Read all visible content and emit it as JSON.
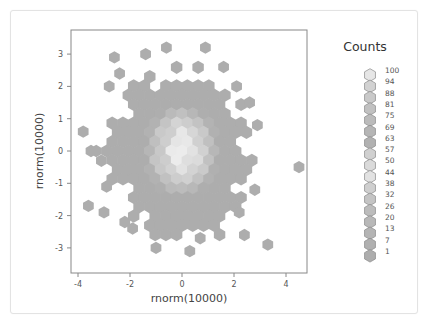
{
  "chart_data": {
    "type": "heatmap",
    "subtype": "hexbin",
    "title": "",
    "xlabel": "rnorm(10000)",
    "ylabel": "rnorm(10000)",
    "xlim": [
      -4.2,
      4.8
    ],
    "ylim": [
      -3.6,
      3.7
    ],
    "x_ticks": [
      -4,
      -2,
      0,
      2,
      4
    ],
    "x_tick_labels": [
      "-4",
      "-2",
      "0",
      "2",
      "4"
    ],
    "y_ticks": [
      -3,
      -2,
      -1,
      0,
      1,
      2,
      3
    ],
    "y_tick_labels": [
      "-3",
      "-2",
      "-1",
      "0",
      "1",
      "2",
      "3"
    ],
    "grid": false,
    "n_points": 10000,
    "distribution": "bivariate standard normal",
    "peak_count": 100,
    "min_count": 1,
    "hex_radius_units": 0.2,
    "sparse_hexes": [
      {
        "x": -3.8,
        "y": 0.6
      },
      {
        "x": -3.5,
        "y": 0.0
      },
      {
        "x": -3.3,
        "y": 0.0
      },
      {
        "x": -3.1,
        "y": -0.3
      },
      {
        "x": -3.6,
        "y": -1.7
      },
      {
        "x": -3.0,
        "y": -1.9
      },
      {
        "x": -2.6,
        "y": 2.9
      },
      {
        "x": -1.4,
        "y": 3.0
      },
      {
        "x": -0.6,
        "y": 3.2
      },
      {
        "x": 0.9,
        "y": 3.2
      },
      {
        "x": 1.6,
        "y": 2.6
      },
      {
        "x": 2.1,
        "y": 2.0
      },
      {
        "x": 2.6,
        "y": 1.5
      },
      {
        "x": 4.5,
        "y": -0.5
      },
      {
        "x": 2.2,
        "y": -1.9
      },
      {
        "x": 3.3,
        "y": -2.9
      },
      {
        "x": -2.9,
        "y": -1.1
      },
      {
        "x": -2.2,
        "y": -2.2
      },
      {
        "x": -1.9,
        "y": -2.4
      },
      {
        "x": 0.3,
        "y": -3.1
      },
      {
        "x": 0.7,
        "y": -2.7
      },
      {
        "x": -1.0,
        "y": -3.0
      },
      {
        "x": 2.4,
        "y": -2.6
      },
      {
        "x": -2.4,
        "y": 2.4
      },
      {
        "x": -2.8,
        "y": 2.0
      },
      {
        "x": 2.9,
        "y": 0.8
      },
      {
        "x": 2.8,
        "y": -1.2
      }
    ]
  },
  "legend": {
    "title": "Counts",
    "levels": [
      "100",
      "94",
      "88",
      "81",
      "75",
      "69",
      "63",
      "57",
      "50",
      "44",
      "38",
      "32",
      "26",
      "20",
      "13",
      "7",
      "1"
    ],
    "colors": [
      "#e6e6e6",
      "#d2d2d2",
      "#c9c9c9",
      "#c1c1c1",
      "#bbbbbb",
      "#b5b5b5",
      "#b1b1b1",
      "#d0d0d0",
      "#dadada",
      "#e2e2e2",
      "#cfcfcf",
      "#c4c4c4",
      "#bcbcbc",
      "#b8b8b8",
      "#b4b4b4",
      "#b0b0b0",
      "#adadad"
    ]
  },
  "colors": {
    "hex_low": "#adadad",
    "hex_high": "#eeeeee",
    "hex_edge": "#9a9a9a",
    "frame": "#888888",
    "card_border": "#e3e3e3"
  }
}
